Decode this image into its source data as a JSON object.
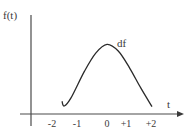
{
  "diagram": {
    "y_axis_label": "f(t)",
    "x_axis_label": "t",
    "curve_label": "df",
    "x_ticks": [
      "-2",
      "-1",
      "0",
      "+1",
      "+2"
    ],
    "curve": {
      "description": "Smooth function starting near t=-2 with a small dip, rising to a maximum at t=0, then falling to reach the t-axis at about t=+2",
      "points": [
        {
          "t": -2.0,
          "f": 0.1
        },
        {
          "t": -1.9,
          "f": 0.03
        },
        {
          "t": -1.6,
          "f": 0.15
        },
        {
          "t": -1.0,
          "f": 0.55
        },
        {
          "t": -0.5,
          "f": 0.82
        },
        {
          "t": 0.0,
          "f": 0.95
        },
        {
          "t": 0.5,
          "f": 0.85
        },
        {
          "t": 1.0,
          "f": 0.6
        },
        {
          "t": 1.5,
          "f": 0.3
        },
        {
          "t": 2.0,
          "f": 0.02
        }
      ]
    },
    "colors": {
      "axis": "#4a4a4a",
      "curve": "#2a2a2a",
      "text": "#3a3a3a"
    }
  }
}
